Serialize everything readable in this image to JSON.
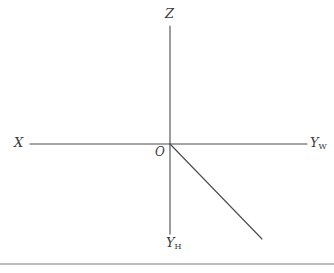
{
  "figure": {
    "type": "coordinate-axis-diagram",
    "background_color": "#ffffff",
    "stroke_color": "#4a4a4a",
    "labels": {
      "z_axis": "Z",
      "x_axis": "X",
      "y_world": "Y",
      "y_world_sub": "W",
      "y_home": "Y",
      "y_home_sub": "H",
      "origin": "O"
    },
    "geometry": {
      "origin": {
        "x": 170,
        "y": 144
      },
      "horizontal_axis": {
        "x1": 30,
        "y1": 144,
        "x2": 307,
        "y2": 144
      },
      "vertical_axis": {
        "x1": 170,
        "y1": 26,
        "x2": 170,
        "y2": 234
      },
      "diagonal_ray": {
        "x1": 170,
        "y1": 144,
        "x2": 262,
        "y2": 239
      },
      "bottom_rule": {
        "x1": 0,
        "y1": 264,
        "x2": 334,
        "y2": 264
      }
    }
  }
}
